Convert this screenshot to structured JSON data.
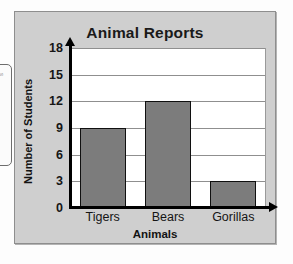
{
  "margin_box": {
    "ghost_label": "s"
  },
  "chart_data": {
    "type": "bar",
    "title": "Animal Reports",
    "xlabel": "Animals",
    "ylabel": "Number of Students",
    "categories": [
      "Tigers",
      "Bears",
      "Gorillas"
    ],
    "values": [
      9,
      12,
      3
    ],
    "ylim": [
      0,
      18
    ],
    "yticks": [
      0,
      3,
      6,
      9,
      12,
      15,
      18
    ],
    "ytick_labels": [
      "0",
      "3",
      "6",
      "9",
      "12",
      "15",
      "18"
    ],
    "grid": true,
    "legend": "none",
    "colors": {
      "bar_fill": "#7c7c7c",
      "bar_border": "#101010",
      "panel_background": "#cfcfcf",
      "plot_background": "#ffffff",
      "gridline": "#8f8f8f",
      "axis": "#000000",
      "text": "#151515"
    }
  }
}
